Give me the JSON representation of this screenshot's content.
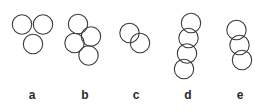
{
  "figure": {
    "stroke_color": "#3a3a3a",
    "circle_radius": 9.7,
    "groups": [
      {
        "label": "a",
        "label_x": 32,
        "circles": [
          {
            "cx": 22,
            "cy": 24.5
          },
          {
            "cx": 43,
            "cy": 24.5
          },
          {
            "cx": 33,
            "cy": 44
          }
        ]
      },
      {
        "label": "b",
        "label_x": 85,
        "circles": [
          {
            "cx": 78,
            "cy": 24
          },
          {
            "cx": 91,
            "cy": 36.5
          },
          {
            "cx": 74.5,
            "cy": 43
          },
          {
            "cx": 88.5,
            "cy": 55.5
          }
        ]
      },
      {
        "label": "c",
        "label_x": 136,
        "circles": [
          {
            "cx": 129.5,
            "cy": 33
          },
          {
            "cx": 140,
            "cy": 43
          }
        ]
      },
      {
        "label": "d",
        "label_x": 188,
        "circles": [
          {
            "cx": 191,
            "cy": 23
          },
          {
            "cx": 188.5,
            "cy": 38
          },
          {
            "cx": 187,
            "cy": 53.5
          },
          {
            "cx": 184,
            "cy": 69
          }
        ]
      },
      {
        "label": "e",
        "label_x": 240,
        "circles": [
          {
            "cx": 236.5,
            "cy": 30
          },
          {
            "cx": 239.5,
            "cy": 45
          },
          {
            "cx": 242,
            "cy": 60
          }
        ]
      }
    ]
  }
}
